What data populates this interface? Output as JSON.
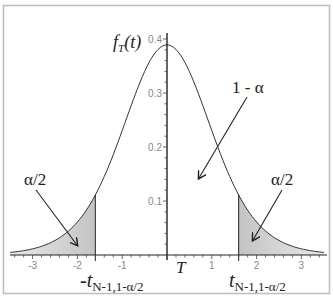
{
  "chart_data": {
    "type": "line",
    "title": "",
    "xlabel": "T",
    "ylabel": "f_T(t)",
    "ylabel_main": "f",
    "ylabel_sub": "T",
    "ylabel_tail": "(t)",
    "xlim": [
      -3.5,
      3.5
    ],
    "ylim": [
      0,
      0.41
    ],
    "grid": false,
    "x_ticks": [
      -3,
      -2,
      -1,
      1,
      2,
      3
    ],
    "x_tick_labels": [
      "-3",
      "-2",
      "-1",
      "1",
      "2",
      "3"
    ],
    "y_ticks": [
      0.1,
      0.2,
      0.3,
      0.4
    ],
    "y_tick_labels": [
      "0.1",
      "0.2",
      "0.3",
      "0.4"
    ],
    "series": [
      {
        "name": "Student t density",
        "x": [
          -3.5,
          -3.0,
          -2.5,
          -2.0,
          -1.6,
          -1.5,
          -1.0,
          -0.5,
          0.0,
          0.5,
          1.0,
          1.5,
          1.6,
          2.0,
          2.5,
          3.0,
          3.5
        ],
        "values": [
          0.005,
          0.011,
          0.027,
          0.061,
          0.111,
          0.127,
          0.23,
          0.34,
          0.389,
          0.34,
          0.23,
          0.127,
          0.111,
          0.061,
          0.027,
          0.011,
          0.005
        ]
      }
    ],
    "critical_values": [
      -1.6,
      1.6
    ],
    "shaded_regions": [
      {
        "from": -3.5,
        "to": -1.6,
        "label": "α/2"
      },
      {
        "from": 1.6,
        "to": 3.5,
        "label": "α/2"
      }
    ],
    "annotations": {
      "center_label": "1 - α",
      "left_tail_label": "α/2",
      "right_tail_label": "α/2",
      "left_critical_prefix": "-t",
      "right_critical_prefix": "t",
      "critical_subscript": "N-1,1-α/2"
    },
    "legend": "none"
  }
}
